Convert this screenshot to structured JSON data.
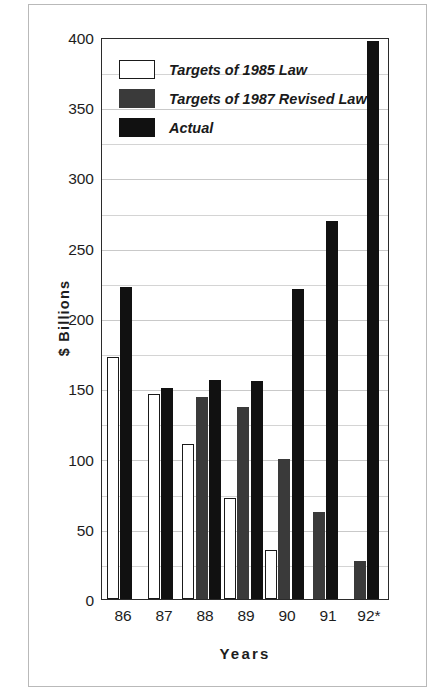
{
  "chart_data": {
    "type": "bar",
    "title": "",
    "xlabel": "Years",
    "ylabel": "$ Billions",
    "categories": [
      "86",
      "87",
      "88",
      "89",
      "90",
      "91",
      "92*"
    ],
    "ylim": [
      0,
      400
    ],
    "ytick_labels": [
      "0",
      "50",
      "100",
      "150",
      "200",
      "250",
      "300",
      "350",
      "400"
    ],
    "ytick_values": [
      0,
      50,
      100,
      150,
      200,
      250,
      300,
      350,
      400
    ],
    "minor_gridline_step": 25,
    "grid": true,
    "legend_position": "upper-left inside plot",
    "series": [
      {
        "name": "Targets of 1985 Law",
        "color": "#ffffff",
        "edge_color": "#1a1a1a",
        "values": [
          172,
          146,
          110,
          72,
          35,
          null,
          null
        ]
      },
      {
        "name": "Targets of 1987 Revised Law",
        "color": "#3a3a3a",
        "edge_color": "#3a3a3a",
        "values": [
          null,
          null,
          144,
          137,
          100,
          62,
          27
        ]
      },
      {
        "name": "Actual",
        "color": "#111111",
        "edge_color": "#111111",
        "values": [
          222,
          150,
          156,
          155,
          221,
          269,
          397
        ]
      }
    ]
  },
  "colors": {
    "targets_1985": "#ffffff",
    "targets_1987": "#3a3a3a",
    "actual": "#111111",
    "axis": "#2b2b2b",
    "gridline": "#d4d4d4",
    "text": "#1d1d1d",
    "frame": "#b9b9b9",
    "background": "#ffffff"
  }
}
